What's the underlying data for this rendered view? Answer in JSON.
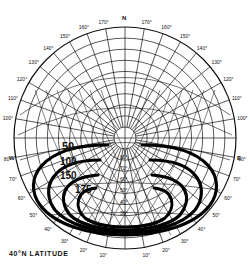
{
  "title": "40°N LATITUDE",
  "compass": {
    "north": "N",
    "west": "W",
    "east": "E"
  },
  "azimuth_labels_left": [
    "100°",
    "110°",
    "120°",
    "130°",
    "140°",
    "150°",
    "160°",
    "170°"
  ],
  "azimuth_labels_right": [
    "170°",
    "160°",
    "150°",
    "140°",
    "130°",
    "120°",
    "110°",
    "100°"
  ],
  "lower_labels_left": [
    "80°",
    "70°",
    "60°",
    "50°",
    "40°",
    "30°",
    "20°",
    "10°"
  ],
  "lower_labels_right": [
    "10°",
    "20°",
    "30°",
    "40°",
    "50°",
    "60°",
    "70°",
    "80°"
  ],
  "altitude_labels": [
    "80°",
    "70°",
    "60°",
    "50°",
    "40°",
    "30°"
  ],
  "contours": [
    {
      "label": "50",
      "value": 50
    },
    {
      "label": "100",
      "value": 100
    },
    {
      "label": "150",
      "value": 150
    },
    {
      "label": "175",
      "value": 175
    }
  ],
  "chart_data": {
    "type": "polar sun-path diagram with contour overlay",
    "title": "40°N LATITUDE",
    "azimuth_ticks_deg": [
      10,
      20,
      30,
      40,
      50,
      60,
      70,
      80,
      90,
      100,
      110,
      120,
      130,
      140,
      150,
      160,
      170,
      180
    ],
    "altitude_rings_deg": [
      10,
      20,
      30,
      40,
      50,
      60,
      70,
      80
    ],
    "contour_levels": [
      50,
      100,
      150,
      175
    ],
    "orientation": {
      "top": "N",
      "left": "W",
      "right": "E"
    }
  }
}
